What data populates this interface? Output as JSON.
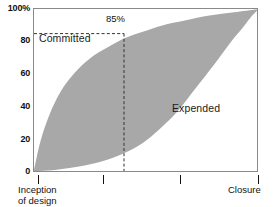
{
  "chart_data": {
    "type": "area",
    "title": "",
    "subtitle": "",
    "xlabel": "",
    "ylabel": "",
    "xlim": [
      0,
      100
    ],
    "ylim": [
      0,
      100
    ],
    "grid": false,
    "legend_position": "inline-annotations",
    "fill_color": "#a8a8a8",
    "axis_color": "#8a8a8a",
    "y_ticks": [
      {
        "value": 100,
        "label": "100%"
      },
      {
        "value": 80,
        "label": "80"
      },
      {
        "value": 60,
        "label": "60"
      },
      {
        "value": 40,
        "label": "40"
      },
      {
        "value": 20,
        "label": "20"
      },
      {
        "value": 0,
        "label": "0"
      }
    ],
    "x_ticks": [
      {
        "value": 2,
        "label": "Inception\nof design",
        "label_line1": "Inception",
        "label_line2": "of design"
      },
      {
        "value": 31,
        "label": ""
      },
      {
        "value": 65,
        "label": ""
      },
      {
        "value": 100,
        "label": "Closure",
        "label_line1": "Closure",
        "label_line2": ""
      }
    ],
    "series": [
      {
        "name": "Committed",
        "label": "Committed",
        "points": [
          {
            "x": 0,
            "y": 2
          },
          {
            "x": 3,
            "y": 20
          },
          {
            "x": 7,
            "y": 36
          },
          {
            "x": 12,
            "y": 50
          },
          {
            "x": 18,
            "y": 61
          },
          {
            "x": 25,
            "y": 70
          },
          {
            "x": 32,
            "y": 76
          },
          {
            "x": 40,
            "y": 82
          },
          {
            "x": 48,
            "y": 86
          },
          {
            "x": 57,
            "y": 90
          },
          {
            "x": 67,
            "y": 93
          },
          {
            "x": 78,
            "y": 96
          },
          {
            "x": 89,
            "y": 98
          },
          {
            "x": 100,
            "y": 100
          }
        ]
      },
      {
        "name": "Expended",
        "label": "Expended",
        "points": [
          {
            "x": 0,
            "y": 1
          },
          {
            "x": 10,
            "y": 2
          },
          {
            "x": 20,
            "y": 4
          },
          {
            "x": 30,
            "y": 7
          },
          {
            "x": 40,
            "y": 12
          },
          {
            "x": 48,
            "y": 18
          },
          {
            "x": 56,
            "y": 27
          },
          {
            "x": 64,
            "y": 38
          },
          {
            "x": 72,
            "y": 52
          },
          {
            "x": 80,
            "y": 66
          },
          {
            "x": 87,
            "y": 79
          },
          {
            "x": 93,
            "y": 89
          },
          {
            "x": 97,
            "y": 96
          },
          {
            "x": 100,
            "y": 100
          }
        ]
      }
    ],
    "annotations": [
      {
        "name": "percent-callout",
        "label": "85%",
        "x": 40,
        "y": 85,
        "guide_horizontal": true,
        "guide_vertical": true,
        "style": "dashed"
      }
    ]
  },
  "labels": {
    "committed": "Committed",
    "expended": "Expended",
    "callout_85": "85%",
    "y_100": "100%",
    "y_80": "80",
    "y_60": "60",
    "y_40": "40",
    "y_20": "20",
    "y_0": "0",
    "x_inception_line1": "Inception",
    "x_inception_line2": "of design",
    "x_closure": "Closure"
  }
}
